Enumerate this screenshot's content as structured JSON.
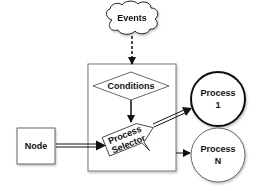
{
  "diagram": {
    "nodes": {
      "events": {
        "label": "Events",
        "shape": "cloud"
      },
      "conditions": {
        "label": "Conditions",
        "shape": "diamond"
      },
      "selector": {
        "line1": "Process",
        "line2": "Selector",
        "shape": "tilted-pentagon"
      },
      "node": {
        "label": "Node",
        "shape": "rectangle"
      },
      "process1": {
        "line1": "Process",
        "line2": "1",
        "shape": "circle"
      },
      "processN": {
        "line1": "Process",
        "line2": "N",
        "shape": "circle"
      }
    },
    "edges": [
      {
        "from": "events",
        "to": "container",
        "style": "dashed"
      },
      {
        "from": "conditions",
        "to": "selector",
        "style": "solid"
      },
      {
        "from": "node",
        "to": "selector",
        "style": "double"
      },
      {
        "from": "selector",
        "to": "process1",
        "style": "double"
      },
      {
        "from": "container",
        "to": "processN",
        "style": "solid"
      }
    ],
    "colors": {
      "stroke": "#222222",
      "fill": "#ffffff",
      "container_stroke": "#777777"
    }
  }
}
